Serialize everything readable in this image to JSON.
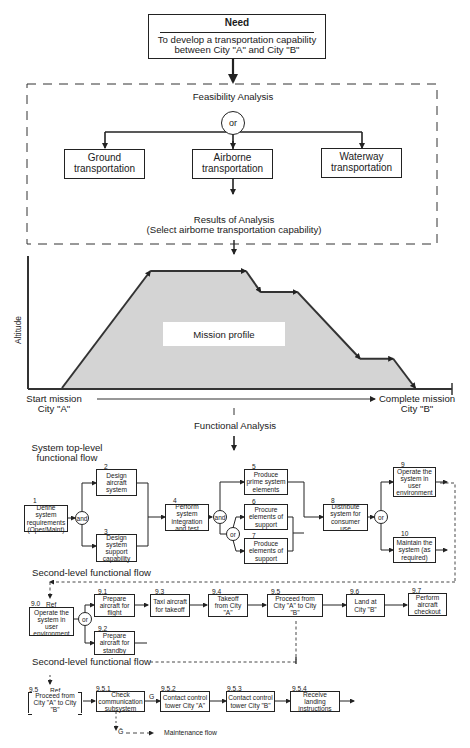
{
  "need": {
    "title": "Need",
    "text_line1": "To develop a transportation capability",
    "text_line2": "between City \"A\" and City \"B\""
  },
  "feasibility": {
    "title": "Feasibility Analysis",
    "gate": "or",
    "options": [
      {
        "line1": "Ground",
        "line2": "transportation"
      },
      {
        "line1": "Airborne",
        "line2": "transportation"
      },
      {
        "line1": "Waterway",
        "line2": "transportation"
      }
    ],
    "results_line1": "Results of Analysis",
    "results_line2": "(Select airborne transportation capability)"
  },
  "mission_profile": {
    "label": "Mission profile",
    "y_axis_label": "Altitude",
    "start_line1": "Start mission",
    "start_line2": "City \"A\"",
    "end_line1": "Complete mission",
    "end_line2": "City \"B\"",
    "fill_color": "#d4d4d4",
    "profile_points": [
      [
        0,
        0
      ],
      [
        0.24,
        1
      ],
      [
        0.5,
        1
      ],
      [
        0.54,
        0.82
      ],
      [
        0.64,
        0.82
      ],
      [
        0.81,
        0.25
      ],
      [
        0.9,
        0.25
      ],
      [
        0.96,
        0
      ]
    ]
  },
  "functional_analysis": {
    "title": "Functional Analysis"
  },
  "top_level": {
    "title_line1": "System top-level",
    "title_line2": "functional flow",
    "blocks": {
      "b1": {
        "num": "1",
        "text": "Define system requirements (Oper/Maint)"
      },
      "b2": {
        "num": "2",
        "text": "Design aircraft system"
      },
      "b3": {
        "num": "3",
        "text": "Design system support capability"
      },
      "b4": {
        "num": "4",
        "text": "Perform system integration and test"
      },
      "b5": {
        "num": "5",
        "text": "Produce prime system elements"
      },
      "b6": {
        "num": "6",
        "text": "Procure elements of support"
      },
      "b7": {
        "num": "7",
        "text": "Produce elements of support"
      },
      "b8": {
        "num": "8",
        "text": "Distribute system for consumer use"
      },
      "b9": {
        "num": "9",
        "text": "Operate the system in user environment"
      },
      "b10": {
        "num": "10",
        "text": "Maintain the system (as required)"
      }
    },
    "gates": {
      "and1": "and",
      "and2": "and",
      "or1": "or",
      "or2": "or"
    }
  },
  "second_level_a": {
    "title": "Second-level functional flow",
    "ref": {
      "num": "9.0",
      "ref_label": "Ref",
      "text": "Operate the system in user environment"
    },
    "gate": "or",
    "blocks": {
      "b91": {
        "num": "9.1",
        "text": "Prepare aircraft for flight"
      },
      "b92": {
        "num": "9.2",
        "text": "Prepare aircraft for standby"
      },
      "b93": {
        "num": "9.3",
        "text": "Taxi aircraft for takeoff"
      },
      "b94": {
        "num": "9.4",
        "text": "Takeoff from City \"A\""
      },
      "b95": {
        "num": "9.5",
        "text": "Proceed from City \"A\" to City \"B\""
      },
      "b96": {
        "num": "9.6",
        "text": "Land at City \"B\""
      },
      "b97": {
        "num": "9.7",
        "text": "Perform aircraft checkout"
      }
    }
  },
  "second_level_b": {
    "title": "Second-level functional flow",
    "ref": {
      "num": "9.5",
      "ref_label": "Ref",
      "text": "Proceed from City \"A\" to City \"B\""
    },
    "blocks": {
      "b951": {
        "num": "9.5.1",
        "text": "Check communication subsystem"
      },
      "b952": {
        "num": "9.5.2",
        "text": "Contact control tower City \"A\""
      },
      "b953": {
        "num": "9.5.3",
        "text": "Contact control tower City \"B\""
      },
      "b954": {
        "num": "9.5.4",
        "text": "Receive landing instructions"
      }
    },
    "go_label": "G",
    "nogo_label": "Ḡ",
    "maintenance_label": "Maintenance flow"
  }
}
